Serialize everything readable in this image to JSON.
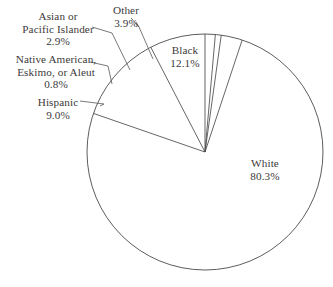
{
  "chart_data": {
    "type": "pie",
    "title": "",
    "subtitle": "",
    "xlabel": "",
    "ylabel": "",
    "legend_position": "callout-labels",
    "grid": false,
    "value_unit": "percent",
    "note": "Segments are labeled with external callout lines; Hispanic overlaps racial categories so values sum to more than 100%.",
    "center": {
      "x": 205,
      "y": 152
    },
    "radius": 118,
    "start_angle_deg": -90,
    "direction": "clockwise",
    "categories": [
      "White",
      "Black",
      "Hispanic",
      "Native American, Eskimo, or Aleut",
      "Asian or Pacific Islander",
      "Other"
    ],
    "values": [
      80.3,
      12.1,
      9.0,
      0.8,
      2.9,
      3.9
    ],
    "slices": [
      {
        "name": "White",
        "value": 80.3,
        "label": "White",
        "percent_label": "80.3%",
        "start_angle_deg": -90,
        "end_angle_deg": 199.08,
        "stroke": "#4a4a4a",
        "fill": "#ffffff",
        "callout": false
      },
      {
        "name": "Black",
        "value": 12.1,
        "label": "Black",
        "percent_label": "12.1%",
        "start_angle_deg": 199.08,
        "end_angle_deg": 242.64,
        "stroke": "#4a4a4a",
        "fill": "#ffffff",
        "callout": false
      },
      {
        "name": "Hispanic",
        "value": 9.0,
        "label": "Hispanic",
        "percent_label": "9.0%",
        "start_angle_deg": 242.64,
        "end_angle_deg": 275.04,
        "stroke": "#4a4a4a",
        "fill": "#ffffff",
        "callout": true
      },
      {
        "name": "Native American, Eskimo, or Aleut",
        "value": 0.8,
        "label": "Native American,\nEskimo, or Aleut",
        "label_line_1": "Native American,",
        "label_line_2": "Eskimo, or Aleut",
        "percent_label": "0.8%",
        "start_angle_deg": 275.04,
        "end_angle_deg": 277.92,
        "stroke": "#4a4a4a",
        "fill": "#ffffff",
        "callout": true
      },
      {
        "name": "Asian or Pacific Islander",
        "value": 2.9,
        "label": "Asian or\nPacific Islander",
        "label_line_1": "Asian or",
        "label_line_2": "Pacific Islander",
        "percent_label": "2.9%",
        "start_angle_deg": 277.92,
        "end_angle_deg": 288.36,
        "stroke": "#4a4a4a",
        "fill": "#ffffff",
        "callout": true
      },
      {
        "name": "Other",
        "value": 3.9,
        "label": "Other",
        "percent_label": "3.9%",
        "start_angle_deg": 288.36,
        "end_angle_deg": 302.4,
        "stroke": "#4a4a4a",
        "fill": "#ffffff",
        "callout": true
      }
    ]
  },
  "labels": {
    "asian": {
      "line1": "Asian or",
      "line2": "Pacific Islander",
      "pct": "2.9%"
    },
    "other": {
      "line1": "Other",
      "pct": "3.9%"
    },
    "native": {
      "line1": "Native American,",
      "line2": "Eskimo, or Aleut",
      "pct": "0.8%"
    },
    "hispanic": {
      "line1": "Hispanic",
      "pct": "9.0%"
    },
    "black": {
      "line1": "Black",
      "pct": "12.1%"
    },
    "white": {
      "line1": "White",
      "pct": "80.3%"
    }
  },
  "colors": {
    "stroke": "#4a4a4a",
    "leader": "#5a5856",
    "text": "#3c3a39",
    "background": "#ffffff",
    "slice_fill": "#ffffff"
  }
}
